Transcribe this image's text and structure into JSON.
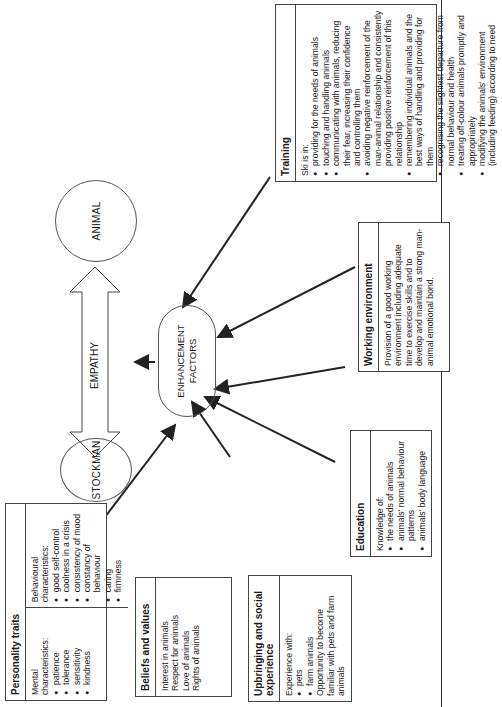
{
  "diagram": {
    "nodes": {
      "stockman": "STOCKMAN",
      "animal": "ANIMAL",
      "empathy": "EMPATHY",
      "enhancement_line1": "ENHANCEMENT",
      "enhancement_line2": "FACTORS"
    },
    "personality": {
      "title": "Personality traits",
      "mental_label": "Mental characteristics:",
      "mental": [
        "patience",
        "tolerance",
        "sensitivity",
        "kindness"
      ],
      "behavioural_label": "Behavioural characteristics:",
      "behavioural": [
        "good self-control",
        "coolness in a crisis",
        "consistency of mood",
        "constancy of behaviour",
        "caring",
        "firmness"
      ]
    },
    "beliefs": {
      "title": "Beliefs and values",
      "items": [
        "Interest in animals",
        "Respect for animals",
        "Love of animals",
        "Rights of animals"
      ]
    },
    "upbringing": {
      "title": "Upbringing and social experience",
      "intro": "Experience with:",
      "items": [
        "pets",
        "farm animals"
      ],
      "outro": "Opportunity to become familiar with pets and farm animals"
    },
    "education": {
      "title": "Education",
      "intro": "Knowledge of:",
      "items": [
        "the needs of animals",
        "animals' normal behaviour patterns",
        "animals' body language"
      ]
    },
    "working": {
      "title": "Working environment",
      "text": "Provision of a good working environment including adequate time to exercise skills and to develop and maintain a strong man-animal emotional bond."
    },
    "training": {
      "title": "Training",
      "intro": "Ski is in:",
      "items": [
        "providing for the needs of animals",
        "touching and handling animals",
        "communicating with animals, reducing their fear, increasing their confidence and controlling them",
        "avoiding negative reinforcement of the man-animal relationship and consistently providing positive reinforcement of this relationship",
        "remembering individual animals and the best ways of handling and providing for them",
        "recognising the slightest departure from normal behaviour and health",
        "treating off-colour animals promptly and appropriately",
        "modifying the animals' environment (including feeding) according to need"
      ]
    }
  }
}
